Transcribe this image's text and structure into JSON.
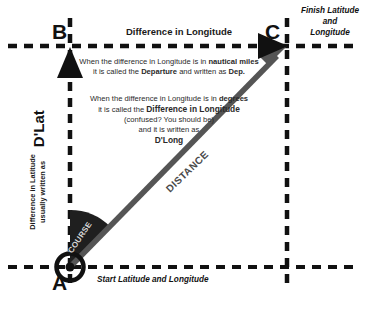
{
  "diagram": {
    "background_color": "#ffffff",
    "line_color_black": "#111111",
    "line_color_grey": "#555555",
    "wedge_color": "#1f1f1f"
  },
  "vertices": {
    "a": {
      "letter": "A",
      "caption": "Start Latitude and Longitude"
    },
    "b": {
      "letter": "B"
    },
    "c": {
      "letter": "C",
      "caption_lines": [
        "Finish Latitude",
        "and",
        "Longitude"
      ]
    }
  },
  "labels": {
    "difference_in_longitude": "Difference in Longitude",
    "distance": "DISTANCE",
    "course": "COURSE",
    "dlat_caption_line1": "Difference in Latitude",
    "dlat_caption_line2": "usually written as",
    "dlat_abbrev": "D'Lat"
  },
  "notes": {
    "nautical": {
      "line1_pre": "When the difference in Longitude is in ",
      "line1_bold": "nautical miles",
      "line2_pre": "it is called the ",
      "line2_bold": "Departure",
      "line2_mid": " and written as ",
      "line2_bold2": "Dep."
    },
    "degrees": {
      "line1_pre": "When the difference in Longitude is in ",
      "line1_bold": "degrees",
      "line2_pre": "it is called the ",
      "line2_bold": "Difference in Longitude",
      "line3": "(confused? You should be)",
      "line4": "and it is written as",
      "line5_bold": "D'Long"
    }
  }
}
